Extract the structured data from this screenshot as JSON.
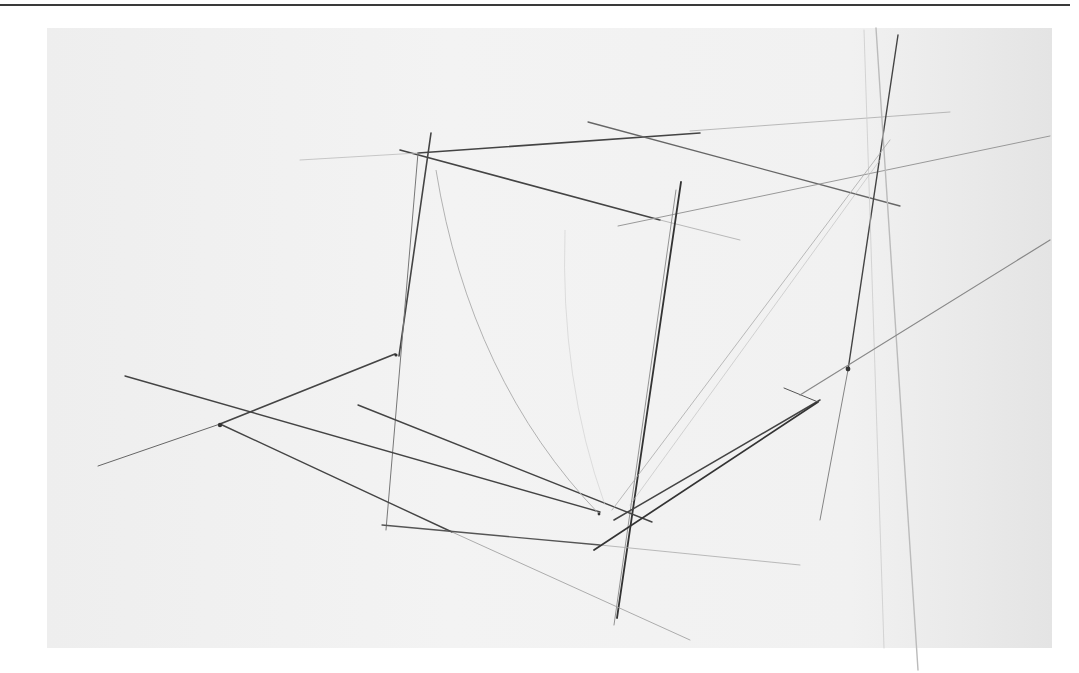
{
  "image": {
    "description": "Pencil perspective sketch of a box/cube with construction lines on scanned paper",
    "background_color": "#ffffff",
    "paper_color": "#f0f0f0",
    "rule_color": "#3a3a3a"
  },
  "strokes": [
    {
      "x1": 400,
      "y1": 150,
      "x2": 660,
      "y2": 220,
      "w": 1.6,
      "c": "#444"
    },
    {
      "x1": 418,
      "y1": 153,
      "x2": 700,
      "y2": 133,
      "w": 1.6,
      "c": "#444"
    },
    {
      "x1": 588,
      "y1": 122,
      "x2": 900,
      "y2": 206,
      "w": 1.3,
      "c": "#666"
    },
    {
      "x1": 300,
      "y1": 160,
      "x2": 418,
      "y2": 153,
      "w": 0.8,
      "c": "#bbb"
    },
    {
      "x1": 690,
      "y1": 131,
      "x2": 950,
      "y2": 112,
      "w": 0.8,
      "c": "#aaa"
    },
    {
      "x1": 618,
      "y1": 226,
      "x2": 1050,
      "y2": 136,
      "w": 1,
      "c": "#999"
    },
    {
      "x1": 660,
      "y1": 220,
      "x2": 740,
      "y2": 240,
      "w": 0.8,
      "c": "#aaa"
    },
    {
      "x1": 431,
      "y1": 133,
      "x2": 399,
      "y2": 356,
      "w": 1.6,
      "c": "#444"
    },
    {
      "x1": 418,
      "y1": 153,
      "x2": 386,
      "y2": 530,
      "w": 1,
      "c": "#777"
    },
    {
      "x1": 681,
      "y1": 182,
      "x2": 617,
      "y2": 618,
      "w": 1.8,
      "c": "#333"
    },
    {
      "x1": 676,
      "y1": 190,
      "x2": 614,
      "y2": 625,
      "w": 0.9,
      "c": "#888"
    },
    {
      "x1": 898,
      "y1": 35,
      "x2": 848,
      "y2": 370,
      "w": 1.4,
      "c": "#444"
    },
    {
      "x1": 848,
      "y1": 370,
      "x2": 820,
      "y2": 520,
      "w": 0.9,
      "c": "#777"
    },
    {
      "x1": 876,
      "y1": 28,
      "x2": 918,
      "y2": 670,
      "w": 1.4,
      "c": "#bbb"
    },
    {
      "x1": 864,
      "y1": 30,
      "x2": 884,
      "y2": 648,
      "w": 0.8,
      "c": "#ccc"
    },
    {
      "x1": 125,
      "y1": 376,
      "x2": 600,
      "y2": 512,
      "w": 1.4,
      "c": "#444"
    },
    {
      "x1": 220,
      "y1": 424,
      "x2": 395,
      "y2": 354,
      "w": 1.8,
      "c": "#444"
    },
    {
      "x1": 98,
      "y1": 466,
      "x2": 220,
      "y2": 424,
      "w": 1,
      "c": "#666"
    },
    {
      "x1": 220,
      "y1": 424,
      "x2": 452,
      "y2": 532,
      "w": 1.4,
      "c": "#444"
    },
    {
      "x1": 452,
      "y1": 532,
      "x2": 690,
      "y2": 640,
      "w": 0.8,
      "c": "#999"
    },
    {
      "x1": 358,
      "y1": 405,
      "x2": 652,
      "y2": 522,
      "w": 1.4,
      "c": "#444"
    },
    {
      "x1": 382,
      "y1": 525,
      "x2": 600,
      "y2": 545,
      "w": 1.3,
      "c": "#555"
    },
    {
      "x1": 600,
      "y1": 545,
      "x2": 800,
      "y2": 565,
      "w": 0.8,
      "c": "#aaa"
    },
    {
      "x1": 614,
      "y1": 520,
      "x2": 820,
      "y2": 400,
      "w": 1.5,
      "c": "#444"
    },
    {
      "x1": 594,
      "y1": 550,
      "x2": 818,
      "y2": 402,
      "w": 1.7,
      "c": "#333"
    },
    {
      "x1": 784,
      "y1": 388,
      "x2": 818,
      "y2": 402,
      "w": 1,
      "c": "#555"
    },
    {
      "x1": 800,
      "y1": 395,
      "x2": 1050,
      "y2": 240,
      "w": 1.2,
      "c": "#888"
    },
    {
      "x1": 612,
      "y1": 510,
      "x2": 890,
      "y2": 140,
      "w": 0.8,
      "c": "#aaa"
    },
    {
      "x1": 630,
      "y1": 505,
      "x2": 880,
      "y2": 160,
      "w": 0.6,
      "c": "#bbb"
    }
  ],
  "curves": [
    {
      "d": "M 436 170 Q 470 380 600 515",
      "w": 0.9,
      "c": "#aaa"
    },
    {
      "d": "M 565 230 Q 560 380 605 505",
      "w": 0.6,
      "c": "#ccc"
    }
  ],
  "dots": [
    {
      "cx": 220,
      "cy": 425,
      "r": 2.2
    },
    {
      "cx": 848,
      "cy": 369,
      "r": 2.4
    },
    {
      "cx": 396,
      "cy": 355,
      "r": 1.6
    },
    {
      "cx": 599,
      "cy": 514,
      "r": 1.4
    }
  ]
}
